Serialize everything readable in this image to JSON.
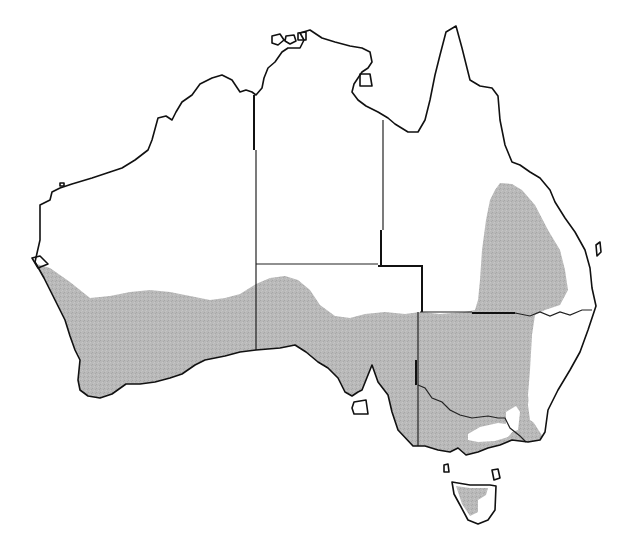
{
  "map": {
    "subject": "Australia distribution map",
    "colors": {
      "background": "#ffffff",
      "land": "#ffffff",
      "coastline": "#111111",
      "state_borders": "#222222",
      "distribution_shade": "#b4b4b4"
    },
    "regions": [
      {
        "name": "Western Australia",
        "shaded": "southern portion"
      },
      {
        "name": "Northern Territory",
        "shaded": "none"
      },
      {
        "name": "South Australia",
        "shaded": "southern portion"
      },
      {
        "name": "Queensland",
        "shaded": "southeast interior"
      },
      {
        "name": "New South Wales",
        "shaded": "western and central"
      },
      {
        "name": "Victoria",
        "shaded": "most, except alpine area"
      },
      {
        "name": "Tasmania",
        "shaded": "partial"
      }
    ]
  }
}
